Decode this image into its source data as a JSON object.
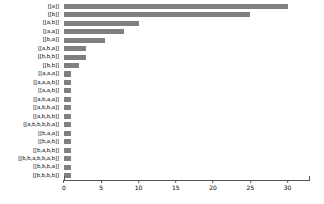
{
  "chart_data": {
    "type": "bar",
    "orientation": "horizontal",
    "title": "",
    "xlabel": "",
    "ylabel": "",
    "xlim": [
      0,
      33
    ],
    "xticks": [
      0,
      5,
      10,
      15,
      20,
      25,
      30
    ],
    "xticklabels": [
      "0",
      "5",
      "10",
      "15",
      "20",
      "25",
      "30"
    ],
    "grid": false,
    "legend": "none",
    "bar_color": "#808080",
    "axis_color": "#555555",
    "categories": [
      "[[a]]",
      "[[b]]",
      "[[a,b]]",
      "[[a,a]]",
      "[[b,a]]",
      "[[a,b,a]]",
      "[[b,b,b]]",
      "[[b,b]]",
      "[[a,a,a]]",
      "[[a,a,a,b]]",
      "[[a,a,b]]",
      "[[a,b,a,a]]",
      "[[a,b,b,a]]",
      "[[a,b,b,b]]",
      "[[a,b,b,b,b,a]]",
      "[[b,a,a]]",
      "[[b,a,b]]",
      "[[b,a,b,b]]",
      "[[b,b,a,b,b,a,b]]",
      "[[b,b,b,a]]",
      "[[b,b,b,b]]"
    ],
    "values": [
      30,
      25,
      10,
      8,
      5.5,
      3,
      3,
      2,
      1,
      1,
      1,
      1,
      1,
      1,
      1,
      1,
      1,
      1,
      1,
      1,
      1
    ]
  }
}
